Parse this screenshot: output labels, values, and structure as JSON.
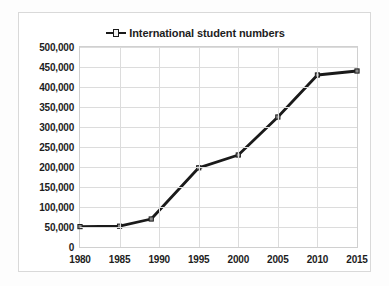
{
  "chart_data": {
    "type": "line",
    "title": "",
    "subtitle": "",
    "xlabel": "",
    "ylabel": "",
    "legend": {
      "position": "top-center",
      "entries": [
        {
          "name": "International student numbers",
          "color": "#1a1a1a",
          "marker": "square"
        }
      ]
    },
    "grid": true,
    "xlim": [
      1980,
      2015
    ],
    "ylim": [
      0,
      500000
    ],
    "x": [
      1980,
      1985,
      1989,
      1995,
      2000,
      2005,
      2010,
      2015
    ],
    "series": [
      {
        "name": "International student numbers",
        "values": [
          51000,
          52000,
          70000,
          198000,
          230000,
          325000,
          430000,
          440000
        ]
      }
    ],
    "x_ticks": [
      1980,
      1985,
      1990,
      1995,
      2000,
      2005,
      2010,
      2015
    ],
    "x_tick_labels": [
      "1980",
      "1985",
      "1990",
      "1995",
      "2000",
      "2005",
      "2010",
      "2015"
    ],
    "y_ticks": [
      0,
      50000,
      100000,
      150000,
      200000,
      250000,
      300000,
      350000,
      400000,
      450000,
      500000
    ],
    "y_tick_labels": [
      "0",
      "50,000",
      "100,000",
      "150,000",
      "200,000",
      "250,000",
      "300,000",
      "350,000",
      "400,000",
      "450,000",
      "500,000"
    ],
    "colors": {
      "series_line": "#1a1a1a",
      "gridline": "#dcdcdc",
      "plot_border": "#d0d0d0",
      "frame_border": "#d9d9d9",
      "text": "#1d1d1d",
      "background": "#ffffff"
    }
  }
}
